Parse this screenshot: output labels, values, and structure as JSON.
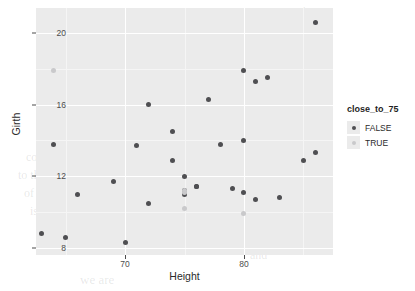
{
  "chart_data": {
    "type": "scatter",
    "title": "",
    "xlabel": "Height",
    "ylabel": "Girth",
    "xlim": [
      62.5,
      87.5
    ],
    "ylim": [
      7.6,
      21.4
    ],
    "xticks": [
      70,
      80
    ],
    "yticks": [
      8,
      12,
      16,
      20
    ],
    "xtick_labels": [
      "70",
      "80"
    ],
    "ytick_labels": [
      "8",
      "12",
      "16",
      "20"
    ],
    "grid": true,
    "panel_background": "#ebebeb",
    "gridline_color": "#ffffff",
    "legend": {
      "title": "close_to_75",
      "position": "right",
      "entries": [
        {
          "label": "FALSE",
          "color": "#4f4f52"
        },
        {
          "label": "TRUE",
          "color": "#c9c9cb"
        }
      ]
    },
    "series": [
      {
        "name": "FALSE",
        "color": "#4f4f52",
        "points": [
          {
            "x": 70.0,
            "y": 8.3
          },
          {
            "x": 65.0,
            "y": 8.6
          },
          {
            "x": 63.0,
            "y": 8.8
          },
          {
            "x": 72.0,
            "y": 10.5
          },
          {
            "x": 81.0,
            "y": 10.7
          },
          {
            "x": 83.0,
            "y": 10.8
          },
          {
            "x": 66.0,
            "y": 11.0
          },
          {
            "x": 75.0,
            "y": 11.0
          },
          {
            "x": 80.0,
            "y": 11.1
          },
          {
            "x": 75.0,
            "y": 11.2
          },
          {
            "x": 79.0,
            "y": 11.3
          },
          {
            "x": 76.0,
            "y": 11.4
          },
          {
            "x": 76.0,
            "y": 11.4
          },
          {
            "x": 69.0,
            "y": 11.7
          },
          {
            "x": 75.0,
            "y": 12.0
          },
          {
            "x": 74.0,
            "y": 12.9
          },
          {
            "x": 85.0,
            "y": 12.9
          },
          {
            "x": 86.0,
            "y": 13.3
          },
          {
            "x": 71.0,
            "y": 13.7
          },
          {
            "x": 64.0,
            "y": 13.8
          },
          {
            "x": 78.0,
            "y": 13.8
          },
          {
            "x": 80.0,
            "y": 14.0
          },
          {
            "x": 74.0,
            "y": 14.5
          },
          {
            "x": 72.0,
            "y": 16.0
          },
          {
            "x": 77.0,
            "y": 16.3
          },
          {
            "x": 81.0,
            "y": 17.3
          },
          {
            "x": 82.0,
            "y": 17.5
          },
          {
            "x": 80.0,
            "y": 17.9
          },
          {
            "x": 86.0,
            "y": 20.6
          }
        ]
      },
      {
        "name": "TRUE",
        "color": "#c9c9cb",
        "points": [
          {
            "x": 64.0,
            "y": 17.9
          },
          {
            "x": 75.0,
            "y": 11.1
          },
          {
            "x": 75.0,
            "y": 11.2
          },
          {
            "x": 75.0,
            "y": 10.2
          },
          {
            "x": 80.0,
            "y": 9.9
          }
        ]
      }
    ]
  },
  "ghost_text": {
    "l1": "the",
    "l2": "in we compute a ratio value of the vector",
    "l3": "linear regression model",
    "l4": "compute a",
    "l5": "to the",
    "l6": "of the data",
    "l7": "is not a",
    "l8": "and",
    "l9": "we are"
  }
}
